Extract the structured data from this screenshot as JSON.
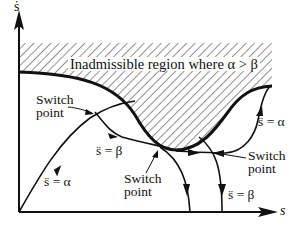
{
  "diagram": {
    "type": "phase-plane",
    "axes": {
      "y_label": "ṡ",
      "x_label": "s"
    },
    "region": {
      "label": "Inadmissible region where α > β",
      "fill": "hatched"
    },
    "labels": {
      "switch_point_left": [
        "Switch",
        "point"
      ],
      "switch_point_mid": [
        "Switch",
        "point"
      ],
      "switch_point_right": [
        "Switch",
        "point"
      ],
      "accel_left": "s̈ = α",
      "decel_mid": "s̈ = β",
      "accel_right": "s̈ = α",
      "decel_right": "s̈ = β"
    },
    "colors": {
      "ink": "#111111",
      "background": "#ffffff"
    }
  }
}
